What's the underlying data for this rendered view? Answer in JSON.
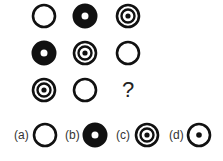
{
  "puzzle": {
    "grid": [
      [
        "ring",
        "thick-donut",
        "target"
      ],
      [
        "thick-donut",
        "target",
        "ring"
      ],
      [
        "target",
        "ring",
        "?"
      ]
    ],
    "question_mark": "?",
    "options": [
      {
        "label": "(a)",
        "shape": "ring"
      },
      {
        "label": "(b)",
        "shape": "thick-donut"
      },
      {
        "label": "(c)",
        "shape": "target"
      },
      {
        "label": "(d)",
        "shape": "ring-dot"
      }
    ]
  }
}
